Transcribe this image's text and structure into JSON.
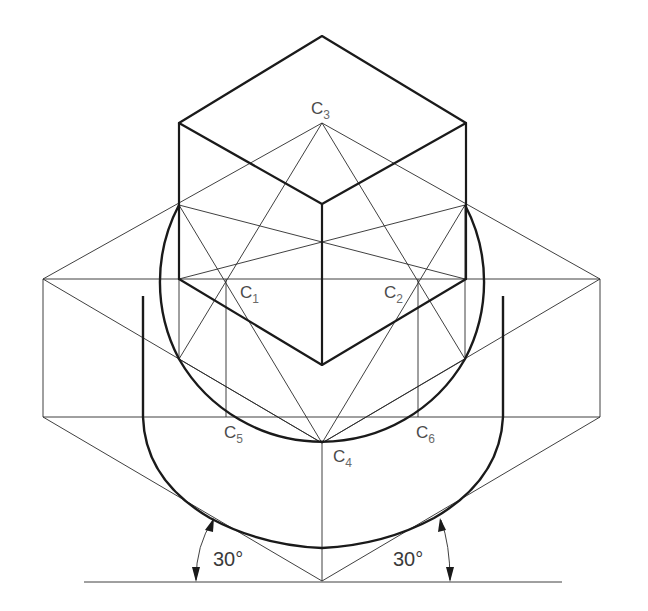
{
  "diagram": {
    "labels": {
      "c1": {
        "main": "C",
        "sub": "1"
      },
      "c2": {
        "main": "C",
        "sub": "2"
      },
      "c3": {
        "main": "C",
        "sub": "3"
      },
      "c4": {
        "main": "C",
        "sub": "4"
      },
      "c5": {
        "main": "C",
        "sub": "5"
      },
      "c6": {
        "main": "C",
        "sub": "6"
      }
    },
    "angles": {
      "left": "30°",
      "right": "30°"
    },
    "colors": {
      "line": "#1a1a1a",
      "label": "#4a4a4a",
      "background": "#ffffff"
    }
  }
}
